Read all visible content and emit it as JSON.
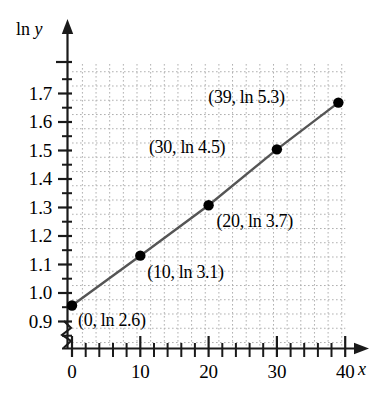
{
  "chart_data": {
    "type": "scatter",
    "title": "",
    "subtitle": "",
    "xlabel": "x",
    "ylabel": "ln y",
    "xlim": [
      0,
      40
    ],
    "ylim": [
      0.875,
      1.775
    ],
    "grid": true,
    "grid_style": "dotted",
    "legend": "none",
    "x_major_ticks": [
      0,
      10,
      20,
      30,
      40
    ],
    "x_major_tick_labels": [
      "0",
      "10",
      "20",
      "30",
      "40"
    ],
    "x_minor_tick_step": 2,
    "y_major_ticks": [
      0.9,
      1.0,
      1.1,
      1.2,
      1.3,
      1.4,
      1.5,
      1.6,
      1.7
    ],
    "y_major_tick_labels": [
      "0.9",
      "1.0",
      "1.1",
      "1.2",
      "1.3",
      "1.4",
      "1.5",
      "1.6",
      "1.7"
    ],
    "y_minor_tick_step": 0.05,
    "x_axis_break": true,
    "series": [
      {
        "name": "ln y vs x",
        "line": true,
        "line_color": "#555555",
        "marker_color": "#000000",
        "points": [
          {
            "x": 0,
            "y": 0.956,
            "label": "(0, ln 2.6)",
            "label_dx": 6,
            "label_dy": 14
          },
          {
            "x": 10,
            "y": 1.131,
            "label": "(10, ln 3.1)",
            "label_dx": 7,
            "label_dy": 16
          },
          {
            "x": 20,
            "y": 1.308,
            "label": "(20, ln 3.7)",
            "label_dx": 8,
            "label_dy": 16
          },
          {
            "x": 30,
            "y": 1.504,
            "label": "(30, ln 4.5)",
            "label_dx": -128,
            "label_dy": -2
          },
          {
            "x": 39,
            "y": 1.668,
            "label": "(39, ln 5.3)",
            "label_dx": -130,
            "label_dy": -6
          }
        ]
      }
    ],
    "annotations": [
      "(0, ln 2.6)",
      "(10, ln 3.1)",
      "(20, ln 3.7)",
      "(30, ln 4.5)",
      "(39, ln 5.3)"
    ]
  },
  "axes": {
    "y_axis_name": "ln y",
    "y_axis_name_roman": "ln",
    "y_axis_name_italic": "y",
    "x_axis_name_italic": "x"
  },
  "colors": {
    "background": "#ffffff",
    "axis": "#1a1a1a",
    "grid": "#b8b8b8",
    "line": "#555555",
    "marker": "#000000",
    "text": "#000000"
  }
}
